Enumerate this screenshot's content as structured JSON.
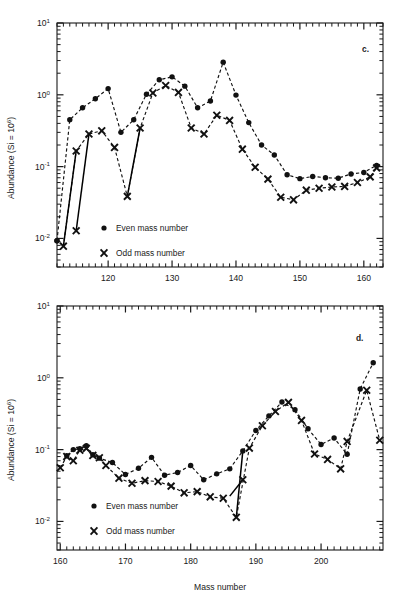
{
  "figure": {
    "xlabel": "Mass number",
    "ylabel_prefix": "Abundance (Si = 10",
    "ylabel_exp": "6",
    "ylabel_suffix": ")",
    "legend": {
      "even_label": "Even mass number",
      "odd_label": "Odd mass number",
      "even_marker": "filled-circle-marker",
      "odd_marker": "cross-marker"
    },
    "panel_c_tag": "c.",
    "panel_d_tag": "d."
  },
  "chart_data": [
    {
      "id": "panel-c",
      "type": "line",
      "title": "c.",
      "xlabel": "",
      "ylabel": "Abundance (Si = 10^6)",
      "yscale": "log",
      "xlim": [
        112,
        163
      ],
      "ylim": [
        0.004,
        10
      ],
      "ytick_labels": [
        "10^1",
        "10^0",
        "10^-1",
        "10^-2"
      ],
      "ytick_values": [
        10,
        1,
        0.1,
        0.01
      ],
      "xtick_labels": [
        "120",
        "130",
        "140",
        "150",
        "160"
      ],
      "xtick_values": [
        120,
        130,
        140,
        150,
        160
      ],
      "xtick_minor_step": 1,
      "grid": false,
      "legend_position": "lower-left",
      "series": [
        {
          "name": "Even mass number",
          "marker": "circle",
          "x": [
            112,
            114,
            116,
            118,
            120,
            122,
            124,
            126,
            128,
            130,
            132,
            134,
            136,
            138,
            140,
            142,
            144,
            146,
            148,
            150,
            152,
            154,
            156,
            158,
            160,
            162
          ],
          "y": [
            0.0093,
            0.45,
            0.66,
            0.88,
            1.22,
            0.3,
            0.45,
            1.02,
            1.62,
            1.78,
            1.32,
            0.66,
            0.82,
            2.85,
            0.99,
            0.41,
            0.2,
            0.145,
            0.077,
            0.068,
            0.073,
            0.07,
            0.069,
            0.079,
            0.083,
            0.104
          ]
        },
        {
          "name": "Odd mass number",
          "marker": "cross",
          "x": [
            113,
            115,
            117,
            119,
            121,
            123,
            125,
            127,
            129,
            131,
            133,
            135,
            137,
            139,
            141,
            143,
            145,
            147,
            149,
            151,
            153,
            155,
            157,
            159,
            161,
            162
          ],
          "y": [
            0.0078,
            0.165,
            0.285,
            0.315,
            0.185,
            0.0385,
            0.345,
            1.06,
            1.35,
            1.08,
            0.345,
            0.285,
            0.52,
            0.44,
            0.175,
            0.098,
            0.067,
            0.0375,
            0.0345,
            0.047,
            0.05,
            0.052,
            0.053,
            0.06,
            0.072,
            0.096
          ]
        }
      ],
      "drop_lines": [
        {
          "from": [
            113,
            0.0078
          ],
          "to": [
            115,
            0.165
          ],
          "note": "steep-rise-segment"
        },
        {
          "from": [
            115,
            0.0128
          ],
          "to": [
            117,
            0.285
          ],
          "note": "steep-rise-segment"
        },
        {
          "from": [
            123,
            0.0385
          ],
          "to": [
            125,
            0.345
          ],
          "note": "steep-rise-segment"
        }
      ],
      "extra_points": [
        {
          "x": 115,
          "y": 0.0128,
          "marker": "cross"
        },
        {
          "x": 112,
          "y": 0.0093,
          "marker": "circle"
        }
      ]
    },
    {
      "id": "panel-d",
      "type": "line",
      "title": "d.",
      "xlabel": "Mass number",
      "ylabel": "Abundance (Si = 10^6)",
      "yscale": "log",
      "xlim": [
        159.5,
        209.5
      ],
      "ylim": [
        0.004,
        10
      ],
      "ytick_labels": [
        "10^1",
        "10^0",
        "10^-1",
        "10^-2"
      ],
      "ytick_values": [
        10,
        1,
        0.1,
        0.01
      ],
      "xtick_labels": [
        "160",
        "170",
        "180",
        "190",
        "200"
      ],
      "xtick_values": [
        160,
        170,
        180,
        190,
        200
      ],
      "xtick_minor_step": 1,
      "grid": false,
      "legend_position": "lower-left",
      "series": [
        {
          "name": "Even mass number",
          "marker": "circle",
          "x": [
            161,
            162,
            163,
            164,
            165,
            166,
            168,
            170,
            172,
            174,
            176,
            178,
            180,
            182,
            184,
            186,
            188,
            190,
            192,
            194,
            196,
            198,
            200,
            202,
            204,
            206,
            208
          ],
          "y": [
            0.082,
            0.1,
            0.103,
            0.113,
            0.085,
            0.076,
            0.066,
            0.045,
            0.055,
            0.078,
            0.044,
            0.048,
            0.06,
            0.038,
            0.046,
            0.054,
            0.096,
            0.185,
            0.295,
            0.46,
            0.36,
            0.195,
            0.118,
            0.145,
            0.086,
            0.7,
            1.62
          ]
        },
        {
          "name": "Odd mass number",
          "marker": "cross",
          "x": [
            160,
            161,
            162,
            163,
            164,
            165,
            166,
            167,
            169,
            171,
            173,
            175,
            177,
            179,
            181,
            183,
            185,
            187,
            189,
            191,
            193,
            195,
            197,
            199,
            201,
            203,
            204,
            207,
            209
          ],
          "y": [
            0.056,
            0.08,
            0.07,
            0.098,
            0.104,
            0.083,
            0.077,
            0.06,
            0.04,
            0.034,
            0.037,
            0.036,
            0.031,
            0.025,
            0.026,
            0.022,
            0.021,
            0.0114,
            0.105,
            0.215,
            0.34,
            0.455,
            0.255,
            0.087,
            0.073,
            0.054,
            0.13,
            0.67,
            0.135
          ]
        }
      ],
      "drop_lines": [
        {
          "from": [
            187,
            0.0114
          ],
          "to": [
            188,
            0.096
          ],
          "note": "steep-rise-segment"
        },
        {
          "from": [
            186,
            0.0225
          ],
          "to": [
            188,
            0.038
          ],
          "note": "short-rise-segment"
        }
      ],
      "extra_points": [
        {
          "x": 188,
          "y": 0.038,
          "marker": "cross"
        }
      ]
    }
  ]
}
